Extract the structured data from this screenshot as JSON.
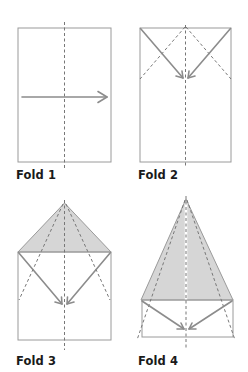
{
  "colors": {
    "background": "#ffffff",
    "paper_edge": "#9a9a9a",
    "fold_shade": "#d6d6d6",
    "dashed_crease": "#777777",
    "arrow": "#8c8c8c",
    "label_text": "#1a1a1a"
  },
  "steps": [
    {
      "label": "Fold 1",
      "description": "Fold sheet in half lengthwise along center crease"
    },
    {
      "label": "Fold 2",
      "description": "Fold top corners down to center line"
    },
    {
      "label": "Fold 3",
      "description": "Fold slanted edges in to center line again"
    },
    {
      "label": "Fold 4",
      "description": "Fold edges in once more to form narrow nose"
    }
  ]
}
